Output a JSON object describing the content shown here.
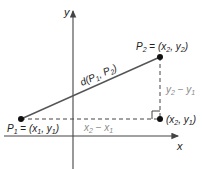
{
  "diagram": {
    "type": "distance-formula-coordinate-plane",
    "axes": {
      "x_label": "x",
      "y_label": "y"
    },
    "points": {
      "p1": {
        "name": "P",
        "sub": "1",
        "coords": "(x",
        "c1sub": "1",
        "mid": ", y",
        "c2sub": "1",
        "close": ")",
        "eq": " = "
      },
      "p2": {
        "name": "P",
        "sub": "2",
        "coords": "(x",
        "c1sub": "2",
        "mid": ", y",
        "c2sub": "2",
        "close": ")",
        "eq": " = "
      },
      "corner": {
        "coords": "(x",
        "c1sub": "2",
        "mid": ", y",
        "c2sub": "1",
        "close": ")"
      }
    },
    "segment_label": {
      "prefix": "d(P",
      "s1": "1",
      "mid": ", P",
      "s2": "2",
      "close": ")"
    },
    "horizontal_leg_label": {
      "a": "x",
      "asub": "2",
      "op": " − ",
      "b": "x",
      "bsub": "1"
    },
    "vertical_leg_label": {
      "a": "y",
      "asub": "2",
      "op": " − ",
      "b": "y",
      "bsub": "1"
    },
    "colors": {
      "line": "#555555",
      "axis": "#444444",
      "point": "#111111",
      "leg_label": "#8a8a8a"
    }
  }
}
